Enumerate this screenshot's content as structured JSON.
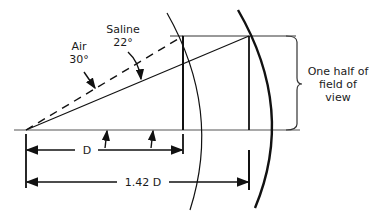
{
  "diagram": {
    "labels": {
      "air": "Air",
      "air_angle": "30°",
      "saline": "Saline",
      "saline_angle": "22°",
      "field_line1": "One half of",
      "field_line2": "field of",
      "field_line3": "view",
      "d": "D",
      "d142": "1.42 D"
    },
    "colors": {
      "stroke": "#111111",
      "axis": "#555555"
    }
  }
}
